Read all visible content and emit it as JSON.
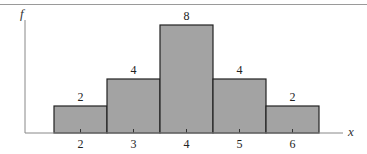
{
  "chart_data": {
    "type": "bar",
    "title": "",
    "xlabel": "x",
    "ylabel": "f",
    "categories": [
      "2",
      "3",
      "4",
      "5",
      "6"
    ],
    "values": [
      2,
      4,
      8,
      4,
      2
    ],
    "value_labels": [
      "2",
      "4",
      "8",
      "4",
      "2"
    ],
    "histogram": true,
    "ylim": [
      0,
      8
    ],
    "grid": false,
    "legend": null,
    "colors": {
      "bar_fill": "#a3a3a3",
      "bar_stroke": "#222222",
      "axis": "#888888"
    }
  }
}
